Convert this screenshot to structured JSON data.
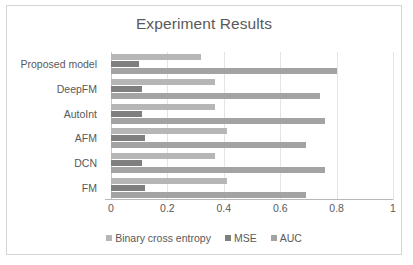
{
  "chart_data": {
    "type": "bar",
    "orientation": "horizontal",
    "title": "Experiment Results",
    "xlabel": "",
    "ylabel": "",
    "xlim": [
      0,
      1
    ],
    "xticks": [
      "0",
      "0.2",
      "0.4",
      "0.6",
      "0.8",
      "1"
    ],
    "xtick_values": [
      0,
      0.2,
      0.4,
      0.6,
      0.8,
      1
    ],
    "grid": true,
    "legend_position": "bottom",
    "categories": [
      "Proposed model",
      "DeepFM",
      "AutoInt",
      "AFM",
      "DCN",
      "FM"
    ],
    "series": [
      {
        "name": "Binary cross entropy",
        "color": "#b6b6b6",
        "values": [
          0.32,
          0.37,
          0.37,
          0.41,
          0.37,
          0.41
        ]
      },
      {
        "name": "MSE",
        "color": "#7f7f7f",
        "values": [
          0.1,
          0.11,
          0.11,
          0.12,
          0.11,
          0.12
        ]
      },
      {
        "name": "AUC",
        "color": "#a3a3a3",
        "values": [
          0.8,
          0.74,
          0.76,
          0.69,
          0.76,
          0.69
        ]
      }
    ]
  },
  "colors": {
    "title_text": "#595959",
    "axis_text": "#595959",
    "gridline": "#e4e4e4",
    "frame_border": "#d4d4d4",
    "background": "#ffffff"
  }
}
